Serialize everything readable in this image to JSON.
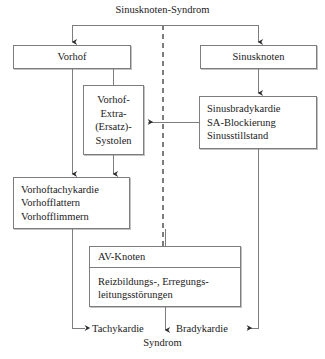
{
  "diagram": {
    "title": "Sinusknoten-Syndrom",
    "nodes": {
      "vorhof": {
        "label": "Vorhof"
      },
      "sinusknoten": {
        "label": "Sinusknoten"
      },
      "extrasystolen": {
        "lines": [
          "Vorhof-",
          "Extra-",
          "(Ersatz)-",
          "Systolen"
        ]
      },
      "sinusbradykardie": {
        "lines": [
          "Sinusbradykardie",
          "SA-Blockierung",
          "Sinusstillstand"
        ]
      },
      "vorhoftachykardie": {
        "lines": [
          "Vorhoftachykardie",
          "Vorhofflattern",
          "Vorhofflimmern"
        ]
      },
      "avknoten": {
        "header": "AV-Knoten",
        "body_lines": [
          "Reizbildungs-, Erregungs-",
          "leitungsstörungen"
        ]
      }
    },
    "outcomes": {
      "tachykardie": "Tachykardie",
      "bradykardie": "Bradykardie",
      "syndrom": "Syndrom"
    },
    "colors": {
      "line": "#7d7d7d",
      "text": "#1a1a1a",
      "background": "#ffffff",
      "shadow": "#b4b4b4"
    }
  }
}
